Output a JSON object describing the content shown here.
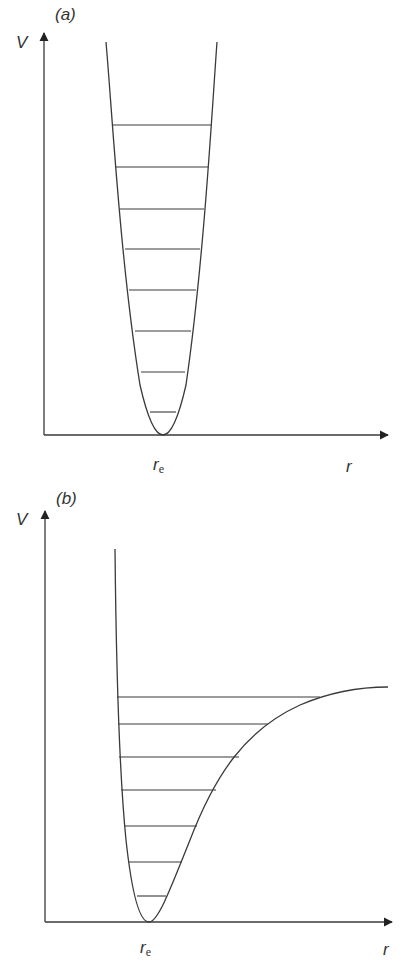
{
  "panels": [
    {
      "id": "a",
      "label": "(a)",
      "y_axis_label": "V",
      "x_axis_label": "r",
      "minimum_label": "r",
      "minimum_label_sub": "e",
      "curve": "harmonic oscillator potential (parabola)",
      "energy_levels": 8,
      "level_spacing": "equal"
    },
    {
      "id": "b",
      "label": "(b)",
      "y_axis_label": "V",
      "x_axis_label": "r",
      "minimum_label": "r",
      "minimum_label_sub": "e",
      "curve": "anharmonic (Morse-type) potential",
      "energy_levels": 7,
      "level_spacing": "converging toward dissociation limit"
    }
  ],
  "colors": {
    "line": "#3a3a3a",
    "background": "#ffffff"
  }
}
